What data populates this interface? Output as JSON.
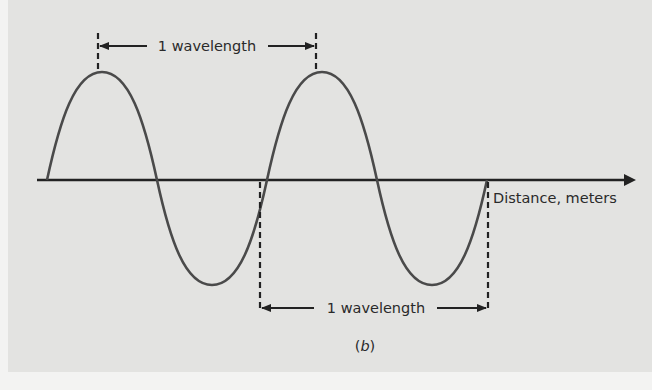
{
  "figure": {
    "top_annotation": "1 wavelength",
    "bottom_annotation": "1 wavelength",
    "axis_label": "Distance, meters",
    "caption_open": "(",
    "caption_letter": "b",
    "caption_close": ")"
  },
  "colors": {
    "panel_background": "#e3e3e1",
    "page_background": "#f3f3f2",
    "wave_stroke": "#4a4a4a",
    "axis_stroke": "#222222"
  },
  "wave": {
    "cycles": 2,
    "start_x": 47,
    "wavelength_px": 220,
    "baseline_y": 180,
    "amplitude_px": 106
  }
}
